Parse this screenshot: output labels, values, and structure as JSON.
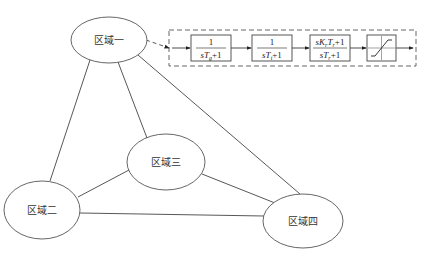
{
  "diagram": {
    "type": "network-with-control-block",
    "nodes": [
      {
        "id": "area1",
        "label": "区域一",
        "cx": 109,
        "cy": 40,
        "rx": 38,
        "ry": 23
      },
      {
        "id": "area2",
        "label": "区域二",
        "cx": 42,
        "cy": 210,
        "rx": 38,
        "ry": 29
      },
      {
        "id": "area3",
        "label": "区域三",
        "cx": 166,
        "cy": 162,
        "rx": 39,
        "ry": 28
      },
      {
        "id": "area4",
        "label": "区域四",
        "cx": 303,
        "cy": 221,
        "rx": 40,
        "ry": 27
      }
    ],
    "edges": [
      {
        "from": "area1",
        "to": "area2"
      },
      {
        "from": "area1",
        "to": "area3"
      },
      {
        "from": "area1",
        "to": "area4"
      },
      {
        "from": "area2",
        "to": "area3"
      },
      {
        "from": "area2",
        "to": "area4"
      },
      {
        "from": "area3",
        "to": "area4"
      }
    ],
    "control_chain": {
      "blocks": [
        {
          "id": "governor",
          "num": "1",
          "den": "sT_g+1"
        },
        {
          "id": "turbine",
          "num": "1",
          "den": "sT_t+1"
        },
        {
          "id": "reheat",
          "num": "sK_rT_r+1",
          "den": "sT_r+1"
        },
        {
          "id": "saturation",
          "type": "saturation-nonlinearity"
        }
      ]
    }
  },
  "labels": {
    "area1": "区域一",
    "area2": "区域二",
    "area3": "区域三",
    "area4": "区域四",
    "block1_num": "1",
    "block2_num": "1",
    "block3_num_pre": "sK",
    "block3_num_sub1": "r",
    "block3_num_mid": "T",
    "block3_num_sub2": "r",
    "block3_num_post": "+1",
    "block1_den_pre": "sT",
    "block1_den_sub": "g",
    "block1_den_post": "+1",
    "block2_den_pre": "sT",
    "block2_den_sub": "t",
    "block2_den_post": "+1",
    "block3_den_pre": "sT",
    "block3_den_sub": "r",
    "block3_den_post": "+1"
  }
}
